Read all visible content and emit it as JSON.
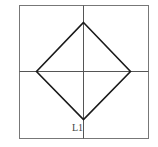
{
  "diagram": {
    "type": "square-with-inscribed-diamond",
    "outer_square": {
      "x1": 19.5,
      "y1": 5.5,
      "x2": 148.5,
      "y2": 138.5
    },
    "vertical_axis_x": 83.5,
    "horizontal_axis_y": 71.5,
    "diamond": {
      "top": [
        83.5,
        22.5
      ],
      "right": [
        130.5,
        71.5
      ],
      "bottom": [
        83.5,
        119.5
      ],
      "left": [
        36.5,
        71.5
      ]
    },
    "labels": [
      {
        "text": "L1",
        "x": 72,
        "y": 131
      }
    ],
    "colors": {
      "frame": "#777777",
      "axis": "#555555",
      "diamond": "#1a1a1a",
      "label": "#444444"
    }
  }
}
